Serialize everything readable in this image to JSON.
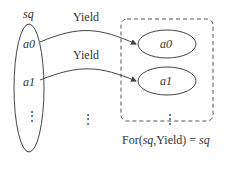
{
  "diagram": {
    "source": {
      "label": "sq",
      "items": [
        "a0",
        "a1"
      ],
      "ellipsis": "⋮"
    },
    "arrows": [
      {
        "label": "Yield"
      },
      {
        "label": "Yield"
      }
    ],
    "middle_ellipsis": "⋮",
    "target": {
      "items": [
        "a0",
        "a1"
      ],
      "ellipsis": "⋮"
    },
    "caption": {
      "prefix": "For(",
      "arg1": "sq",
      "mid": ",Yield) = ",
      "result": "sq"
    }
  }
}
